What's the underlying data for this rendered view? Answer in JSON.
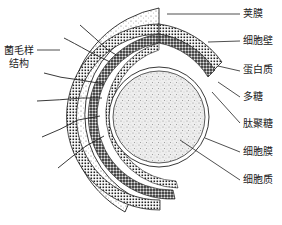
{
  "diagram": {
    "type": "bacterial cell structure cross-section",
    "top_caption_partial": "",
    "labels_right": [
      {
        "text": "荚膜",
        "y": 14
      },
      {
        "text": "细胞壁",
        "y": 41
      },
      {
        "text": "蛋白质",
        "y": 68
      },
      {
        "text": "多糖",
        "y": 95
      },
      {
        "text": "肽聚糖",
        "y": 123
      },
      {
        "text": "细胞膜",
        "y": 151
      },
      {
        "text": "细胞质",
        "y": 179
      }
    ],
    "label_left": {
      "line1": "菌毛样",
      "line2": "结构"
    },
    "colors": {
      "ink": "#222222",
      "background": "#ffffff"
    }
  }
}
